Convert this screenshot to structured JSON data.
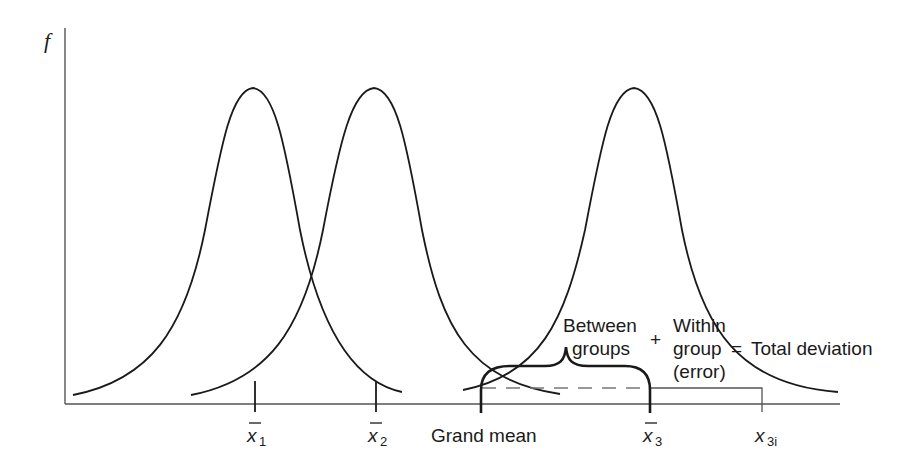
{
  "diagram": {
    "y_axis_label": "f",
    "x_ticks": [
      {
        "symbol": "x̄",
        "sub": "1"
      },
      {
        "symbol": "x̄",
        "sub": "2"
      },
      {
        "symbol": "x̄",
        "sub": "3"
      },
      {
        "symbol": "x",
        "sub": "3i"
      }
    ],
    "grand_mean_label": "Grand mean",
    "annotation": {
      "between_line1": "Between",
      "between_line2": "groups",
      "plus": "+",
      "within_line1": "Within",
      "within_line2": "group",
      "equals": "=",
      "total": "Total deviation",
      "within_line3": "(error)"
    },
    "curves": [
      {
        "name": "group-1-distribution",
        "peak_x": 253
      },
      {
        "name": "group-2-distribution",
        "peak_x": 374
      },
      {
        "name": "group-3-distribution",
        "peak_x": 634
      }
    ],
    "colors": {
      "ink": "#1a1a1a",
      "axis": "#555555",
      "dashed": "#777777"
    }
  }
}
